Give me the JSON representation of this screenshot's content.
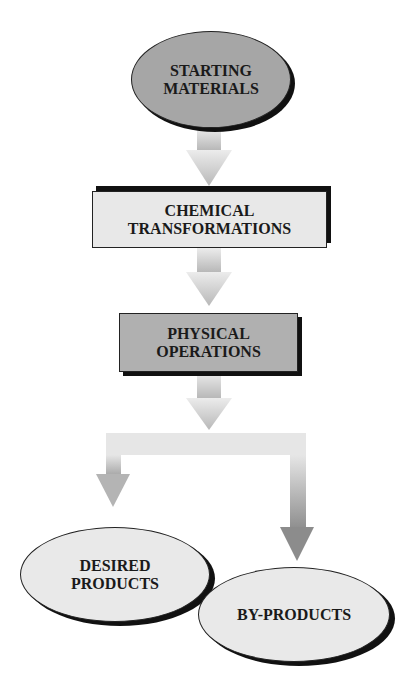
{
  "diagram": {
    "type": "flowchart",
    "colors": {
      "start_fill": "#a6a6a6",
      "chemical_fill": "#e8e8e8",
      "physical_fill": "#b0b0b0",
      "product_fill": "#e9e9e9",
      "arrow_light": "#e2e2e2",
      "arrow_dark": "#9a9a9a",
      "shadow": "#111111"
    },
    "nodes": {
      "starting_materials": {
        "line1": "STARTING",
        "line2": "MATERIALS",
        "shape": "ellipse"
      },
      "chemical_transformations": {
        "line1": "CHEMICAL",
        "line2": "TRANSFORMATIONS",
        "shape": "rectangle"
      },
      "physical_operations": {
        "line1": "PHYSICAL",
        "line2": "OPERATIONS",
        "shape": "rectangle"
      },
      "desired_products": {
        "line1": "DESIRED",
        "line2": "PRODUCTS",
        "shape": "ellipse"
      },
      "by_products": {
        "line1": "BY-PRODUCTS",
        "shape": "ellipse"
      }
    },
    "edges": [
      {
        "from": "starting_materials",
        "to": "chemical_transformations"
      },
      {
        "from": "chemical_transformations",
        "to": "physical_operations"
      },
      {
        "from": "physical_operations",
        "to": "desired_products"
      },
      {
        "from": "physical_operations",
        "to": "by_products"
      }
    ]
  }
}
